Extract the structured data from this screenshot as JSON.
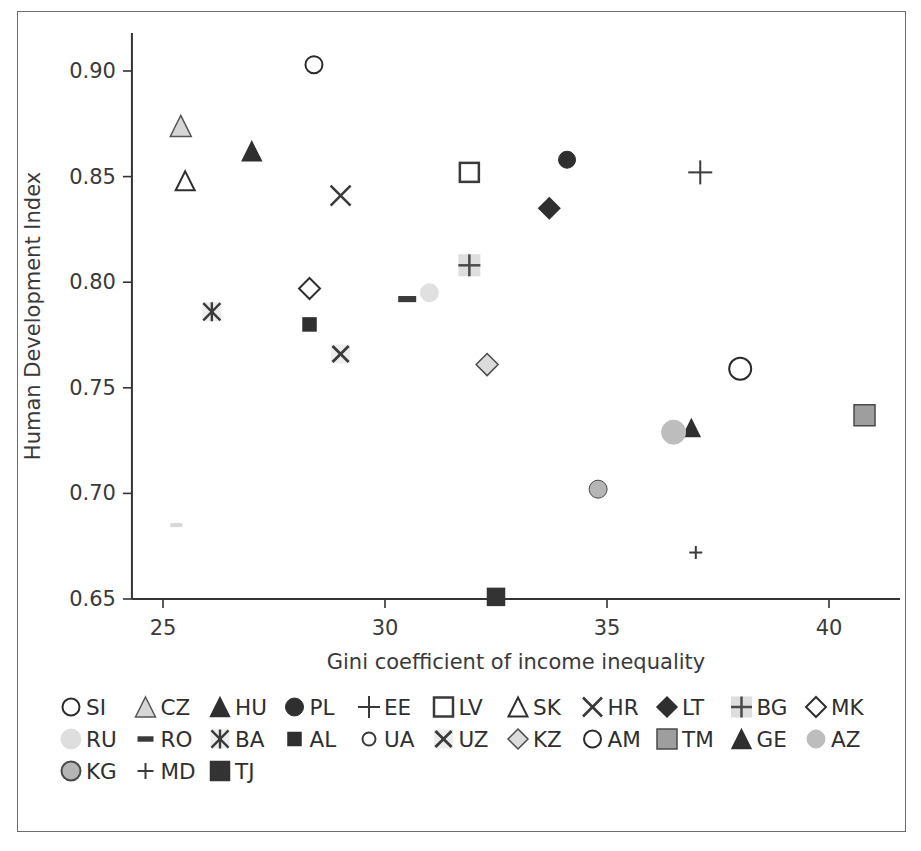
{
  "chart_data": {
    "type": "scatter",
    "title": "",
    "xlabel": "Gini coefficient of income inequality",
    "ylabel": "Human Development Index",
    "xlim": [
      24.3,
      41.6
    ],
    "ylim": [
      0.65,
      0.918
    ],
    "xticks": [
      25,
      30,
      35,
      40
    ],
    "yticks": [
      0.65,
      0.7,
      0.75,
      0.8,
      0.85,
      0.9
    ],
    "xticklabels": [
      "25",
      "30",
      "35",
      "40"
    ],
    "yticklabels": [
      "0.65",
      "0.70",
      "0.75",
      "0.80",
      "0.85",
      "0.90"
    ],
    "grid": false,
    "legend_position": "bottom",
    "points": [
      {
        "label": "SI",
        "x": 28.4,
        "y": 0.903,
        "marker": "circle-open",
        "fill": "none",
        "stroke": "#2b2b2b",
        "size": 17
      },
      {
        "label": "CZ",
        "x": 25.4,
        "y": 0.874,
        "marker": "triangle",
        "fill": "#d6d6d6",
        "stroke": "#555555",
        "size": 21
      },
      {
        "label": "HU",
        "x": 27.0,
        "y": 0.862,
        "marker": "triangle",
        "fill": "#2f2f2f",
        "stroke": "#2f2f2f",
        "size": 19
      },
      {
        "label": "PL",
        "x": 34.1,
        "y": 0.858,
        "marker": "circle",
        "fill": "#2f2f2f",
        "stroke": "#2f2f2f",
        "size": 17
      },
      {
        "label": "EE",
        "x": 37.1,
        "y": 0.852,
        "marker": "plus-large",
        "fill": "none",
        "stroke": "#3a3a3a",
        "size": 24
      },
      {
        "label": "LV",
        "x": 31.9,
        "y": 0.852,
        "marker": "square-open",
        "fill": "none",
        "stroke": "#3a3a3a",
        "size": 19
      },
      {
        "label": "SK",
        "x": 25.5,
        "y": 0.848,
        "marker": "triangle-open",
        "fill": "none",
        "stroke": "#2f2f2f",
        "size": 19
      },
      {
        "label": "HR",
        "x": 29.0,
        "y": 0.841,
        "marker": "x-mark",
        "fill": "none",
        "stroke": "#3a3a3a",
        "size": 20
      },
      {
        "label": "LT",
        "x": 33.7,
        "y": 0.835,
        "marker": "diamond",
        "fill": "#2f2f2f",
        "stroke": "#2f2f2f",
        "size": 21
      },
      {
        "label": "BG",
        "x": 31.9,
        "y": 0.808,
        "marker": "plus-box",
        "fill": "#dedede",
        "stroke": "#4a4a4a",
        "size": 22
      },
      {
        "label": "MK",
        "x": 28.3,
        "y": 0.797,
        "marker": "diamond-open",
        "fill": "none",
        "stroke": "#2f2f2f",
        "size": 21
      },
      {
        "label": "UA",
        "x": 31.0,
        "y": 0.795,
        "marker": "circle",
        "fill": "#e0e0e0",
        "stroke": "#e0e0e0",
        "size": 18
      },
      {
        "label": "RO",
        "x": 30.5,
        "y": 0.792,
        "marker": "dash",
        "fill": "#3a3a3a",
        "stroke": "#3a3a3a",
        "size": 18
      },
      {
        "label": "BA",
        "x": 26.1,
        "y": 0.786,
        "marker": "asterisk-box",
        "fill": "#ededed",
        "stroke": "#3a3a3a",
        "size": 19
      },
      {
        "label": "AL",
        "x": 28.3,
        "y": 0.78,
        "marker": "square",
        "fill": "#2f2f2f",
        "stroke": "#2f2f2f",
        "size": 13
      },
      {
        "label": "UZ",
        "x": 29.0,
        "y": 0.766,
        "marker": "x-box",
        "fill": "#ededed",
        "stroke": "#3a3a3a",
        "size": 19
      },
      {
        "label": "KZ",
        "x": 32.3,
        "y": 0.761,
        "marker": "diamond",
        "fill": "#dcdcdc",
        "stroke": "#4a4a4a",
        "size": 22
      },
      {
        "label": "AM",
        "x": 38.0,
        "y": 0.759,
        "marker": "circle-open",
        "fill": "none",
        "stroke": "#2b2b2b",
        "size": 22
      },
      {
        "label": "TM",
        "x": 40.8,
        "y": 0.737,
        "marker": "square",
        "fill": "#9e9e9e",
        "stroke": "#4a4a4a",
        "size": 21
      },
      {
        "label": "GE",
        "x": 36.9,
        "y": 0.731,
        "marker": "triangle",
        "fill": "#2f2f2f",
        "stroke": "#2f2f2f",
        "size": 17
      },
      {
        "label": "AZ",
        "x": 36.5,
        "y": 0.729,
        "marker": "circle",
        "fill": "#bdbdbd",
        "stroke": "#bdbdbd",
        "size": 24
      },
      {
        "label": "KG",
        "x": 34.8,
        "y": 0.702,
        "marker": "circle",
        "fill": "#b5b5b5",
        "stroke": "#4a4a4a",
        "size": 18
      },
      {
        "label": "RU",
        "x": 25.3,
        "y": 0.685,
        "marker": "dash",
        "fill": "#d8d8d8",
        "stroke": "#d8d8d8",
        "size": 12
      },
      {
        "label": "MD",
        "x": 37.0,
        "y": 0.672,
        "marker": "plus-small",
        "fill": "none",
        "stroke": "#3a3a3a",
        "size": 13
      },
      {
        "label": "TJ",
        "x": 32.5,
        "y": 0.651,
        "marker": "square",
        "fill": "#333333",
        "stroke": "#333333",
        "size": 17
      }
    ]
  },
  "legend": {
    "rows": [
      [
        {
          "label": "SI",
          "marker": "circle-open"
        },
        {
          "label": "CZ",
          "marker": "triangle-gray"
        },
        {
          "label": "HU",
          "marker": "triangle"
        },
        {
          "label": "PL",
          "marker": "circle"
        },
        {
          "label": "EE",
          "marker": "plus-large"
        },
        {
          "label": "LV",
          "marker": "square-open"
        },
        {
          "label": "SK",
          "marker": "triangle-open"
        },
        {
          "label": "HR",
          "marker": "x-mark"
        },
        {
          "label": "LT",
          "marker": "diamond"
        },
        {
          "label": "BG",
          "marker": "plus-box"
        },
        {
          "label": "MK",
          "marker": "diamond-open"
        }
      ],
      [
        {
          "label": "RU",
          "marker": "circle-light"
        },
        {
          "label": "RO",
          "marker": "dash"
        },
        {
          "label": "BA",
          "marker": "asterisk-box"
        },
        {
          "label": "AL",
          "marker": "square-small"
        },
        {
          "label": "UA",
          "marker": "circle-open-small"
        },
        {
          "label": "UZ",
          "marker": "x-box"
        },
        {
          "label": "KZ",
          "marker": "diamond-gray"
        },
        {
          "label": "AM",
          "marker": "circle-open"
        },
        {
          "label": "TM",
          "marker": "square-gray"
        },
        {
          "label": "GE",
          "marker": "triangle"
        },
        {
          "label": "AZ",
          "marker": "circle-gray"
        }
      ],
      [
        {
          "label": "KG",
          "marker": "circle-gray-outline"
        },
        {
          "label": "MD",
          "marker": "plus-small"
        },
        {
          "label": "TJ",
          "marker": "square-dark"
        }
      ]
    ]
  }
}
